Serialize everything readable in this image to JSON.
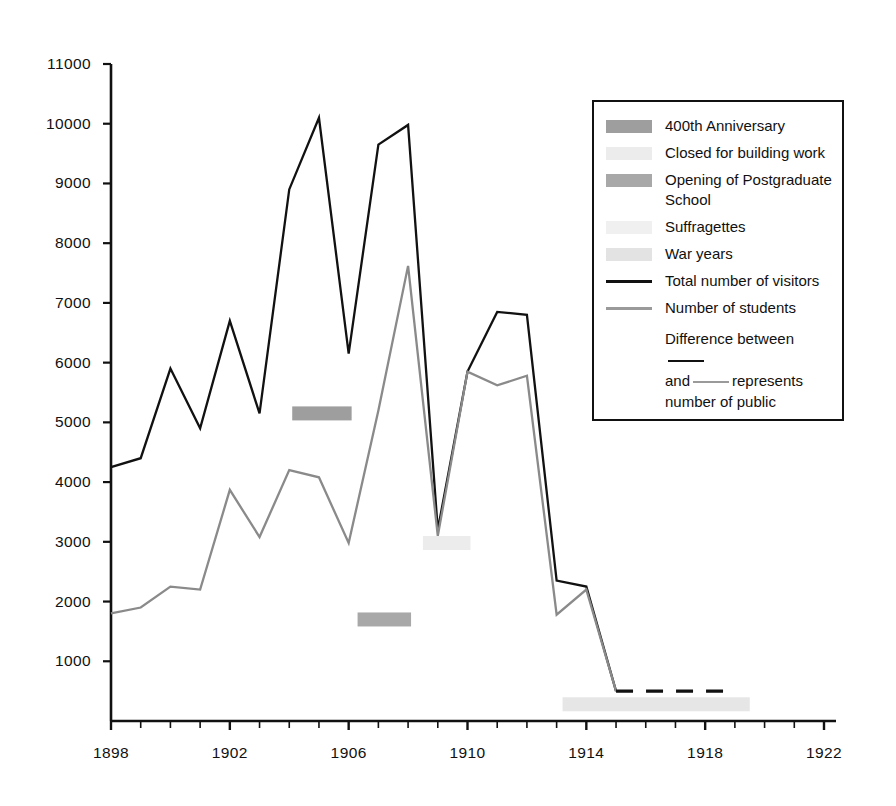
{
  "chart_data": {
    "type": "line",
    "title": "",
    "xlabel": "",
    "ylabel": "",
    "xlim": [
      1898,
      1922
    ],
    "ylim": [
      0,
      11000
    ],
    "grid": false,
    "x_tick_labels": [
      "1898",
      "1902",
      "1906",
      "1910",
      "1914",
      "1918",
      "1922"
    ],
    "x_tick_values": [
      1898,
      1902,
      1906,
      1910,
      1914,
      1918,
      1922
    ],
    "x_minor_tick_step": 1,
    "y_tick_labels": [
      "1000",
      "2000",
      "3000",
      "4000",
      "5000",
      "6000",
      "7000",
      "8000",
      "9000",
      "10000",
      "11000"
    ],
    "y_tick_values": [
      1000,
      2000,
      3000,
      4000,
      5000,
      6000,
      7000,
      8000,
      9000,
      10000,
      11000
    ],
    "legend_position": "upper-right-inset",
    "x": [
      1898,
      1899,
      1900,
      1901,
      1902,
      1903,
      1904,
      1905,
      1906,
      1907,
      1908,
      1909,
      1910,
      1911,
      1912,
      1913,
      1914,
      1915
    ],
    "series": [
      {
        "name": "Total number of visitors",
        "color": "#111111",
        "style": "solid",
        "values": [
          4250,
          4400,
          5900,
          4900,
          6700,
          5150,
          8900,
          10100,
          6150,
          9650,
          9980,
          3200,
          5850,
          6850,
          6800,
          2350,
          2250,
          500
        ]
      },
      {
        "name": "Number of students",
        "color": "#8a8a8a",
        "style": "solid",
        "values": [
          1800,
          1900,
          2250,
          2200,
          3870,
          3080,
          4200,
          4080,
          2980,
          5200,
          7620,
          3100,
          5850,
          5620,
          5780,
          1780,
          2200,
          500
        ]
      },
      {
        "name": "Dashed continuation",
        "color": "#111111",
        "style": "dashed",
        "x": [
          1915,
          1919
        ],
        "values": [
          500,
          500
        ]
      }
    ],
    "annotation_bands": [
      {
        "label": "400th Anniversary",
        "x_start": 1904.1,
        "x_end": 1906.1,
        "y_value": 5150,
        "color": "#9e9e9e"
      },
      {
        "label": "Opening of Postgraduate School",
        "x_start": 1906.3,
        "x_end": 1908.1,
        "y_value": 1700,
        "color": "#a8a8a8"
      },
      {
        "label": "Closed for building work",
        "x_start": 1908.5,
        "x_end": 1910.1,
        "y_value": 2980,
        "color": "#ececec"
      },
      {
        "label": "War years",
        "x_start": 1913.2,
        "x_end": 1919.5,
        "y_value": 280,
        "color": "#e6e6e6"
      }
    ]
  },
  "legend": {
    "items": [
      {
        "label": "400th Anniversary",
        "swatch": "#9e9e9e",
        "kind": "swatch"
      },
      {
        "label": "Closed for building work",
        "swatch": "#ececec",
        "kind": "swatch"
      },
      {
        "label": "Opening of Postgraduate School",
        "swatch": "#a8a8a8",
        "kind": "swatch"
      },
      {
        "label": "Suffragettes",
        "swatch": "#f0f0f0",
        "kind": "swatch"
      },
      {
        "label": "War years",
        "swatch": "#e3e3e3",
        "kind": "swatch"
      },
      {
        "label": "Total number of visitors",
        "swatch": "#111111",
        "kind": "line"
      },
      {
        "label": "Number of students",
        "swatch": "#9a9a9a",
        "kind": "line"
      }
    ],
    "note_part1": "Difference between",
    "note_part2": "and",
    "note_part3": "represents",
    "note_part4": "number of public",
    "note_rule1_color": "#111111",
    "note_rule2_color": "#9a9a9a"
  },
  "colors": {
    "axis": "#111111",
    "total_visitors": "#111111",
    "students": "#8a8a8a",
    "background": "#ffffff"
  }
}
